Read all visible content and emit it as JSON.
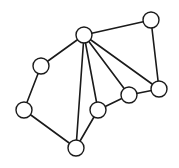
{
  "diagram": {
    "type": "undirected-graph",
    "node_radius": 8,
    "stroke_color": "#1a1a1a",
    "fill_color": "#ffffff",
    "nodes": [
      {
        "id": "A",
        "x": 84,
        "y": 35
      },
      {
        "id": "B",
        "x": 151,
        "y": 20
      },
      {
        "id": "C",
        "x": 41,
        "y": 66
      },
      {
        "id": "D",
        "x": 24,
        "y": 110
      },
      {
        "id": "E",
        "x": 76,
        "y": 148
      },
      {
        "id": "F",
        "x": 98,
        "y": 110
      },
      {
        "id": "G",
        "x": 129,
        "y": 95
      },
      {
        "id": "H",
        "x": 159,
        "y": 89
      }
    ],
    "edges": [
      [
        "A",
        "B"
      ],
      [
        "A",
        "C"
      ],
      [
        "A",
        "E"
      ],
      [
        "A",
        "F"
      ],
      [
        "A",
        "G"
      ],
      [
        "A",
        "H"
      ],
      [
        "B",
        "H"
      ],
      [
        "C",
        "D"
      ],
      [
        "D",
        "E"
      ],
      [
        "E",
        "F"
      ],
      [
        "F",
        "G"
      ],
      [
        "G",
        "H"
      ]
    ]
  }
}
